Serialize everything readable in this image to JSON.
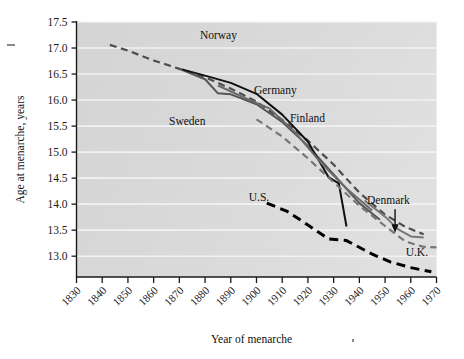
{
  "chart_data": {
    "type": "line",
    "title": "",
    "xlabel": "Year of menarche",
    "ylabel": "Age at menarche, years",
    "xlim": [
      1830,
      1970
    ],
    "ylim": [
      12.6,
      17.5
    ],
    "grid": true,
    "grid_orientation": "horizontal",
    "legend": "inline-labels",
    "xticks": [
      "1830",
      "1840",
      "1850",
      "1860",
      "1870",
      "1880",
      "1890",
      "1900",
      "1910",
      "1920",
      "1930",
      "1940",
      "1950",
      "1960",
      "1970"
    ],
    "yticks": [
      "17.5",
      "17.0",
      "16.5",
      "16.0",
      "15.5",
      "15.0",
      "14.5",
      "14.0",
      "13.5",
      "13.0"
    ],
    "plot_bg_color": "#d2d2d2",
    "gridline_color": "#f2f2f2",
    "axis_color": "#1a1a1a",
    "series": [
      {
        "name": "Norway",
        "style": "dashed",
        "color": "#4d4d4d",
        "label_x": 1878,
        "label_y": 17.18,
        "points": [
          [
            1843,
            17.06
          ],
          [
            1850,
            16.95
          ],
          [
            1860,
            16.76
          ],
          [
            1870,
            16.6
          ],
          [
            1880,
            16.44
          ],
          [
            1890,
            16.22
          ],
          [
            1900,
            15.97
          ],
          [
            1910,
            15.62
          ],
          [
            1920,
            15.22
          ],
          [
            1930,
            14.76
          ],
          [
            1940,
            14.22
          ],
          [
            1950,
            13.8
          ],
          [
            1958,
            13.56
          ],
          [
            1965,
            13.42
          ]
        ]
      },
      {
        "name": "Sweden",
        "style": "solid",
        "color": "#555555",
        "label_x": 1866,
        "label_y": 15.52,
        "points": [
          [
            1871,
            16.58
          ],
          [
            1880,
            16.4
          ],
          [
            1885,
            16.13
          ],
          [
            1890,
            16.11
          ],
          [
            1900,
            15.92
          ],
          [
            1910,
            15.58
          ],
          [
            1920,
            15.12
          ],
          [
            1930,
            14.57
          ],
          [
            1940,
            14.02
          ],
          [
            1948,
            13.7
          ]
        ]
      },
      {
        "name": "Germany",
        "style": "solid",
        "color": "#111111",
        "label_x": 1899,
        "label_y": 16.12,
        "points": [
          [
            1871,
            16.59
          ],
          [
            1880,
            16.47
          ],
          [
            1890,
            16.33
          ],
          [
            1900,
            16.12
          ],
          [
            1910,
            15.72
          ],
          [
            1920,
            15.2
          ],
          [
            1928,
            14.52
          ],
          [
            1932,
            14.4
          ],
          [
            1935,
            13.57
          ]
        ]
      },
      {
        "name": "Finland",
        "style": "solid",
        "color": "#6a6a6a",
        "label_x": 1913,
        "label_y": 15.57,
        "points": [
          [
            1885,
            16.28
          ],
          [
            1895,
            16.05
          ],
          [
            1905,
            15.84
          ],
          [
            1915,
            15.38
          ],
          [
            1925,
            14.8
          ],
          [
            1935,
            14.3
          ],
          [
            1945,
            13.88
          ]
        ]
      },
      {
        "name": "U.S.",
        "style": "dashed-bold",
        "color": "#000000",
        "label_x": 1897,
        "label_y": 14.06,
        "points": [
          [
            1904,
            14.02
          ],
          [
            1912,
            13.86
          ],
          [
            1920,
            13.6
          ],
          [
            1928,
            13.33
          ],
          [
            1935,
            13.3
          ],
          [
            1945,
            13.04
          ],
          [
            1952,
            12.89
          ],
          [
            1960,
            12.78
          ],
          [
            1968,
            12.7
          ]
        ]
      },
      {
        "name": "Denmark",
        "style": "solid",
        "color": "#787878",
        "label_x": 1943,
        "label_y": 14.0,
        "annotation": "arrow",
        "points": [
          [
            1942,
            14.07
          ],
          [
            1950,
            13.76
          ],
          [
            1955,
            13.52
          ],
          [
            1960,
            13.38
          ],
          [
            1965,
            13.36
          ]
        ]
      },
      {
        "name": "U.K.",
        "style": "dashed",
        "color": "#767676",
        "label_x": 1958,
        "label_y": 13.0,
        "points": [
          [
            1900,
            15.63
          ],
          [
            1910,
            15.3
          ],
          [
            1920,
            14.88
          ],
          [
            1930,
            14.42
          ],
          [
            1940,
            13.97
          ],
          [
            1950,
            13.58
          ],
          [
            1958,
            13.28
          ],
          [
            1965,
            13.18
          ],
          [
            1970,
            13.17
          ]
        ]
      }
    ]
  }
}
